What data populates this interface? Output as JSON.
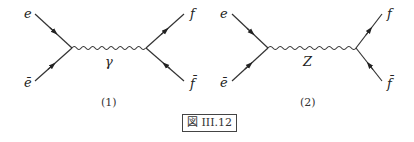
{
  "figure": {
    "caption": "図 III.12",
    "line_color": "#333333",
    "diagrams": [
      {
        "id": "1",
        "label": "(1)",
        "boson": "γ",
        "incoming": [
          "e",
          "ē"
        ],
        "outgoing": [
          "f",
          "f̄"
        ]
      },
      {
        "id": "2",
        "label": "(2)",
        "boson": "Z",
        "incoming": [
          "e",
          "ē"
        ],
        "outgoing": [
          "f",
          "f̄"
        ]
      }
    ]
  }
}
